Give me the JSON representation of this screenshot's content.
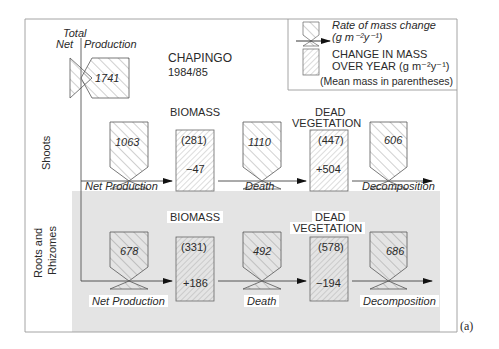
{
  "figure": {
    "title": "CHAPINGO",
    "period": "1984/85",
    "panel_label": "(a)",
    "total_label_line1": "Total",
    "total_label_net": "Net",
    "total_label_production": "Production",
    "total_net_production": "1741"
  },
  "legend": {
    "rate_label_line1": "Rate of mass change",
    "rate_label_line2": "(g m⁻²y⁻¹)",
    "change_label_line1": "CHANGE IN MASS",
    "change_label_line2": "OVER YEAR (g m⁻²y⁻¹)",
    "mean_note": "(Mean mass in parentheses)"
  },
  "rows": [
    {
      "name": "Shoots",
      "label": "Shoots",
      "biomass_heading": "BIOMASS",
      "dead_heading_line1": "DEAD",
      "dead_heading_line2": "VEGETATION",
      "net_production": {
        "label": "Net Production",
        "value": "1063"
      },
      "biomass": {
        "mean": "(281)",
        "change": "−47"
      },
      "death": {
        "label": "Death",
        "value": "1110"
      },
      "dead_vegetation": {
        "mean": "(447)",
        "change": "+504"
      },
      "decomposition": {
        "label": "Decomposition",
        "value": "606"
      }
    },
    {
      "name": "Roots and Rhizomes",
      "label_line1": "Roots and",
      "label_line2": "Rhizomes",
      "biomass_heading": "BIOMASS",
      "dead_heading_line1": "DEAD",
      "dead_heading_line2": "VEGETATION",
      "net_production": {
        "label": "Net Production",
        "value": "678"
      },
      "biomass": {
        "mean": "(331)",
        "change": "+186"
      },
      "death": {
        "label": "Death",
        "value": "492"
      },
      "dead_vegetation": {
        "mean": "(578)",
        "change": "−194"
      },
      "decomposition": {
        "label": "Decomposition",
        "value": "686"
      }
    }
  ],
  "colors": {
    "line": "#3a3a3a",
    "shade": "#e4e4e4",
    "hatch": "#8a8a8a",
    "frame": "#9a9a9a"
  }
}
